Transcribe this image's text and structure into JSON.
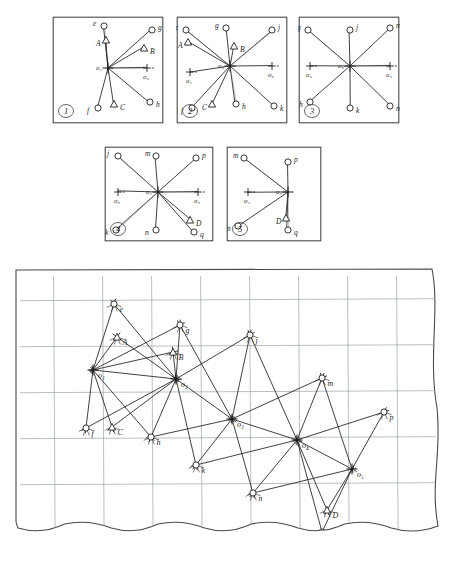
{
  "document": {
    "type": "hand-drawn technical survey diagram",
    "description": "Five small station panels above a large torn-edge grid sheet showing a triangulation / resection network",
    "ink_color": "#1f1f1f",
    "grid_color": "#9aa3ab",
    "paper_color": "#ffffff"
  },
  "panels": [
    {
      "id": "panel-1",
      "number": "1",
      "x": 52,
      "y": 16,
      "w": 112,
      "h": 108,
      "center": {
        "label": "o₁",
        "cx": 56,
        "cy": 52
      },
      "marks": [
        {
          "name": "o2",
          "label": "o₂",
          "x": 95,
          "y": 52,
          "kind": "cross"
        }
      ],
      "rays": [
        {
          "target": "e",
          "label": "e",
          "tx": 52,
          "ty": 10,
          "node": "circle"
        },
        {
          "target": "A",
          "label": "A",
          "tx": 54,
          "ty": 24,
          "node": "triangle"
        },
        {
          "target": "g",
          "label": "g",
          "tx": 100,
          "ty": 14,
          "node": "circle"
        },
        {
          "target": "B",
          "label": "B",
          "tx": 92,
          "ty": 32,
          "node": "triangle"
        },
        {
          "target": "o2",
          "label": "",
          "tx": 95,
          "ty": 52,
          "node": "cross"
        },
        {
          "target": "h",
          "label": "h",
          "tx": 98,
          "ty": 86,
          "node": "circle"
        },
        {
          "target": "C",
          "label": "C",
          "tx": 62,
          "ty": 88,
          "node": "triangle"
        },
        {
          "target": "f",
          "label": "f",
          "tx": 46,
          "ty": 92,
          "node": "circle"
        }
      ]
    },
    {
      "id": "panel-2",
      "number": "2",
      "x": 176,
      "y": 16,
      "w": 112,
      "h": 108,
      "center": {
        "label": "o₂",
        "cx": 54,
        "cy": 50
      },
      "marks": [
        {
          "name": "o1",
          "label": "o₁",
          "x": 14,
          "y": 56,
          "kind": "cross"
        },
        {
          "name": "o3",
          "label": "o₃",
          "x": 96,
          "y": 50,
          "kind": "cross"
        }
      ],
      "rays": [
        {
          "target": "e",
          "label": "e",
          "tx": 10,
          "ty": 14,
          "node": "circle"
        },
        {
          "target": "A",
          "label": "A",
          "tx": 12,
          "ty": 26,
          "node": "triangle"
        },
        {
          "target": "g",
          "label": "g",
          "tx": 50,
          "ty": 12,
          "node": "circle"
        },
        {
          "target": "B",
          "label": "B",
          "tx": 58,
          "ty": 30,
          "node": "triangle"
        },
        {
          "target": "j",
          "label": "j",
          "tx": 96,
          "ty": 14,
          "node": "circle"
        },
        {
          "target": "o1",
          "label": "",
          "tx": 14,
          "ty": 56,
          "node": "cross"
        },
        {
          "target": "o3",
          "label": "",
          "tx": 96,
          "ty": 50,
          "node": "cross"
        },
        {
          "target": "k",
          "label": "k",
          "tx": 98,
          "ty": 90,
          "node": "circle"
        },
        {
          "target": "h",
          "label": "h",
          "tx": 60,
          "ty": 88,
          "node": "circle"
        },
        {
          "target": "C",
          "label": "C",
          "tx": 36,
          "ty": 88,
          "node": "triangle"
        },
        {
          "target": "f",
          "label": "f",
          "tx": 16,
          "ty": 92,
          "node": "circle"
        }
      ]
    },
    {
      "id": "panel-3",
      "number": "3",
      "x": 298,
      "y": 16,
      "w": 102,
      "h": 108,
      "center": {
        "label": "o₃",
        "cx": 52,
        "cy": 50
      },
      "marks": [
        {
          "name": "o2",
          "label": "o₂",
          "x": 12,
          "y": 50,
          "kind": "cross"
        },
        {
          "name": "o4",
          "label": "o₄",
          "x": 92,
          "y": 50,
          "kind": "cross"
        }
      ],
      "rays": [
        {
          "target": "g",
          "label": "g",
          "tx": 10,
          "ty": 14,
          "node": "circle"
        },
        {
          "target": "j",
          "label": "j",
          "tx": 52,
          "ty": 14,
          "node": "circle"
        },
        {
          "target": "m",
          "label": "m",
          "tx": 92,
          "ty": 12,
          "node": "circle"
        },
        {
          "target": "o2",
          "label": "",
          "tx": 12,
          "ty": 50,
          "node": "cross"
        },
        {
          "target": "o4",
          "label": "",
          "tx": 92,
          "ty": 50,
          "node": "cross"
        },
        {
          "target": "n",
          "label": "n",
          "tx": 92,
          "ty": 90,
          "node": "circle"
        },
        {
          "target": "k",
          "label": "k",
          "tx": 52,
          "ty": 92,
          "node": "circle"
        },
        {
          "target": "h",
          "label": "h",
          "tx": 12,
          "ty": 86,
          "node": "circle"
        }
      ]
    },
    {
      "id": "panel-4",
      "number": "4",
      "x": 104,
      "y": 146,
      "w": 110,
      "h": 96,
      "center": {
        "label": "o₄",
        "cx": 54,
        "cy": 46
      },
      "marks": [
        {
          "name": "o3",
          "label": "o₃",
          "x": 14,
          "y": 46,
          "kind": "cross"
        },
        {
          "name": "o5",
          "label": "o₅",
          "x": 94,
          "y": 46,
          "kind": "cross"
        }
      ],
      "rays": [
        {
          "target": "j",
          "label": "j",
          "tx": 14,
          "ty": 10,
          "node": "circle"
        },
        {
          "target": "m",
          "label": "m",
          "tx": 52,
          "ty": 10,
          "node": "circle"
        },
        {
          "target": "p",
          "label": "p",
          "tx": 92,
          "ty": 12,
          "node": "circle"
        },
        {
          "target": "o3",
          "label": "",
          "tx": 14,
          "ty": 46,
          "node": "cross"
        },
        {
          "target": "o5",
          "label": "",
          "tx": 94,
          "ty": 46,
          "node": "cross"
        },
        {
          "target": "D",
          "label": "D",
          "tx": 86,
          "ty": 74,
          "node": "triangle"
        },
        {
          "target": "q",
          "label": "q",
          "tx": 90,
          "ty": 86,
          "node": "circle"
        },
        {
          "target": "n",
          "label": "n",
          "tx": 52,
          "ty": 84,
          "node": "circle"
        },
        {
          "target": "k",
          "label": "k",
          "tx": 12,
          "ty": 84,
          "node": "circle"
        }
      ]
    },
    {
      "id": "panel-5",
      "number": "5",
      "x": 226,
      "y": 146,
      "w": 96,
      "h": 96,
      "center": {
        "label": "o₅",
        "cx": 62,
        "cy": 46
      },
      "marks": [
        {
          "name": "o4",
          "label": "o₄",
          "x": 22,
          "y": 46,
          "kind": "cross"
        }
      ],
      "rays": [
        {
          "target": "m",
          "label": "m",
          "tx": 18,
          "ty": 12,
          "node": "circle"
        },
        {
          "target": "p",
          "label": "p",
          "tx": 62,
          "ty": 16,
          "node": "circle"
        },
        {
          "target": "o4",
          "label": "",
          "tx": 22,
          "ty": 46,
          "node": "cross"
        },
        {
          "target": "D",
          "label": "D",
          "tx": 60,
          "ty": 72,
          "node": "triangle"
        },
        {
          "target": "q",
          "label": "q",
          "tx": 62,
          "ty": 84,
          "node": "circle"
        },
        {
          "target": "n",
          "label": "n",
          "tx": 12,
          "ty": 80,
          "node": "circle"
        }
      ]
    }
  ],
  "main_sheet": {
    "id": "main-sheet",
    "x": 14,
    "y": 268,
    "w": 430,
    "h": 288,
    "grid": {
      "columns": 8,
      "rows": 5,
      "spacing_x": 49,
      "spacing_y": 46,
      "color": "#9aa3ab"
    },
    "stations": [
      {
        "name": "o1",
        "label": "o₁",
        "x": 93,
        "y": 370,
        "kind": "station"
      },
      {
        "name": "o2",
        "label": "o₂",
        "x": 176,
        "y": 379,
        "kind": "station"
      },
      {
        "name": "o3",
        "label": "o₃",
        "x": 232,
        "y": 419,
        "kind": "station"
      },
      {
        "name": "o4",
        "label": "o₄",
        "x": 297,
        "y": 440,
        "kind": "station"
      },
      {
        "name": "o5",
        "label": "o₅",
        "x": 352,
        "y": 469,
        "kind": "station"
      }
    ],
    "targets": [
      {
        "name": "e",
        "label": "e",
        "x": 114,
        "y": 304,
        "kind": "circle"
      },
      {
        "name": "A",
        "label": "A",
        "x": 117,
        "y": 337,
        "kind": "triangle"
      },
      {
        "name": "g",
        "label": "g",
        "x": 180,
        "y": 325,
        "kind": "circle"
      },
      {
        "name": "B",
        "label": "B",
        "x": 173,
        "y": 352,
        "kind": "triangle"
      },
      {
        "name": "f",
        "label": "f",
        "x": 86,
        "y": 428,
        "kind": "circle"
      },
      {
        "name": "C",
        "label": "C",
        "x": 112,
        "y": 427,
        "kind": "triangle"
      },
      {
        "name": "h",
        "label": "h",
        "x": 151,
        "y": 437,
        "kind": "circle"
      },
      {
        "name": "j",
        "label": "j",
        "x": 250,
        "y": 335,
        "kind": "circle"
      },
      {
        "name": "k",
        "label": "k",
        "x": 196,
        "y": 465,
        "kind": "circle"
      },
      {
        "name": "m",
        "label": "m",
        "x": 322,
        "y": 378,
        "kind": "circle"
      },
      {
        "name": "n",
        "label": "n",
        "x": 253,
        "y": 493,
        "kind": "circle"
      },
      {
        "name": "p",
        "label": "p",
        "x": 384,
        "y": 412,
        "kind": "circle"
      },
      {
        "name": "D",
        "label": "D",
        "x": 327,
        "y": 510,
        "kind": "triangle"
      },
      {
        "name": "q",
        "label": "q",
        "x": 322,
        "y": 532,
        "kind": "circle"
      }
    ],
    "sight_lines": [
      [
        "o1",
        "e"
      ],
      [
        "o1",
        "A"
      ],
      [
        "o1",
        "g"
      ],
      [
        "o1",
        "B"
      ],
      [
        "o1",
        "o2"
      ],
      [
        "o1",
        "h"
      ],
      [
        "o1",
        "C"
      ],
      [
        "o1",
        "f"
      ],
      [
        "o2",
        "e"
      ],
      [
        "o2",
        "A"
      ],
      [
        "o2",
        "g"
      ],
      [
        "o2",
        "B"
      ],
      [
        "o2",
        "j"
      ],
      [
        "o2",
        "o3"
      ],
      [
        "o2",
        "k"
      ],
      [
        "o2",
        "h"
      ],
      [
        "o2",
        "C"
      ],
      [
        "o2",
        "f"
      ],
      [
        "o3",
        "g"
      ],
      [
        "o3",
        "j"
      ],
      [
        "o3",
        "m"
      ],
      [
        "o3",
        "o4"
      ],
      [
        "o3",
        "n"
      ],
      [
        "o3",
        "k"
      ],
      [
        "o3",
        "h"
      ],
      [
        "o4",
        "j"
      ],
      [
        "o4",
        "m"
      ],
      [
        "o4",
        "p"
      ],
      [
        "o4",
        "o5"
      ],
      [
        "o4",
        "D"
      ],
      [
        "o4",
        "q"
      ],
      [
        "o4",
        "n"
      ],
      [
        "o4",
        "k"
      ],
      [
        "o5",
        "m"
      ],
      [
        "o5",
        "p"
      ],
      [
        "o5",
        "D"
      ],
      [
        "o5",
        "q"
      ],
      [
        "o5",
        "n"
      ]
    ]
  },
  "legend": {
    "circle_meaning": "observed target point",
    "triangle_meaning": "triangulation beacon",
    "cross_meaning": "instrument station"
  }
}
